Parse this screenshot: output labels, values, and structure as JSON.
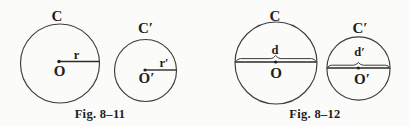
{
  "colors": {
    "ink": "#1e1e1e",
    "stroke": "#3c3c3c",
    "background": "#fbfbf9"
  },
  "figures": [
    {
      "caption": "Fig. 8–11",
      "measure_type": "radius",
      "circles": [
        {
          "label": "C",
          "center_label": "O",
          "measure_label": "r"
        },
        {
          "label": "C′",
          "center_label": "O′",
          "measure_label": "r′"
        }
      ]
    },
    {
      "caption": "Fig. 8–12",
      "measure_type": "diameter",
      "circles": [
        {
          "label": "C",
          "center_label": "O",
          "measure_label": "d"
        },
        {
          "label": "C′",
          "center_label": "O′",
          "measure_label": "d′"
        }
      ]
    }
  ]
}
